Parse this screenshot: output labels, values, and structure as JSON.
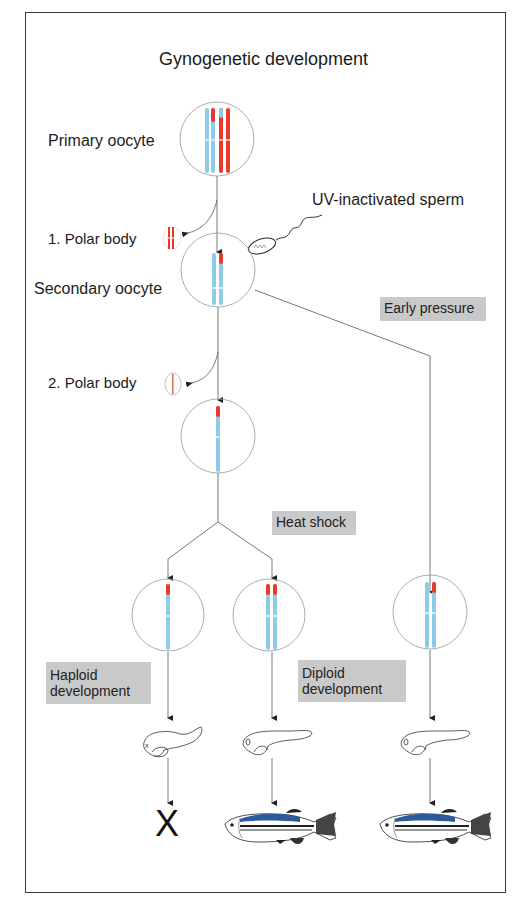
{
  "title": "Gynogenetic development",
  "stages": {
    "primary_oocyte": "Primary oocyte",
    "polar_body_1": "1. Polar body",
    "uv_sperm": "UV-inactivated sperm",
    "secondary_oocyte": "Secondary oocyte",
    "polar_body_2": "2. Polar body"
  },
  "treatments": {
    "early_pressure": "Early pressure",
    "heat_shock": "Heat shock"
  },
  "outcomes": {
    "haploid_line1": "Haploid",
    "haploid_line2": "development",
    "diploid_line1": "Diploid",
    "diploid_line2": "development",
    "haploid_result": "X"
  },
  "colors": {
    "maternal_chromosome": "#8ccbea",
    "paternal_segment": "#e8392a",
    "box_fill": "#c9c9c9",
    "line": "#555555",
    "fish_stripe": "#2d5a9a"
  }
}
